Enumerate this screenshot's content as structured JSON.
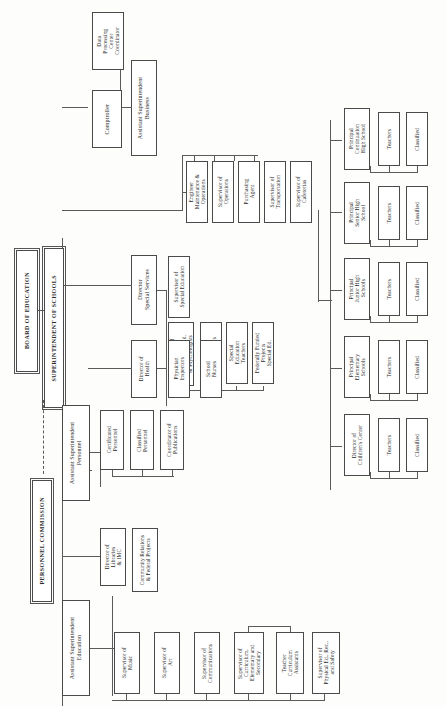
{
  "diagram": {
    "type": "organization-chart",
    "orientation": "rotated-90-text-vertical",
    "line_color": "#5a5a5a",
    "box_fill": "#ffffff",
    "box_border": "#4a4a4a"
  },
  "nodes": {
    "board_of_education": "BOARD OF EDUCATION",
    "superintendent_of_schools": "SUPERINTENDENT OF SCHOOLS",
    "personnel_commission": "PERSONNEL COMMISSION",
    "asst_supt_business": "Assistant Superintendent\nBusiness",
    "asst_supt_personnel": "Assistant Superintendent\nPersonnel",
    "asst_supt_education": "Assistant Superintendent\nEducation",
    "data_processing_center_coordinator": "Data\nProcessing\nCenter\nCoordinator",
    "comptroller": "Comptroller",
    "engineer_maintenance_operations": "Engineer\nMaintenance &\nOperations",
    "supervisor_of_operations": "Supervisor of\nOperations",
    "purchasing_agent": "Purchasing\nAgent",
    "supervisor_of_transportation": "Supervisor of\nTransportation",
    "supervisor_of_cafeterias": "Supervisor of\nCafeterias",
    "director_special_services": "Director\nSpecial Services",
    "supervisor_of_special_education": "Supervisor of\nSpecial Education",
    "supervisor_child_welfare": "Supervisor of\nChild\nWelfare, Attend.\n& Psychologists",
    "school_psychologists": "School\nPsychologists",
    "special_education_teachers": "Special\nEducation\nTeachers",
    "federally_funded_projects_special_ed": "Federally Funded\nProjects\nSpecial Ed.",
    "director_of_health": "Director of\nHealth",
    "physician_inspectors": "Physician\nInspectors",
    "school_nurses": "School\nNurses",
    "certificated_personnel": "Certificated\nPersonnel",
    "classified_personnel": "Classified\nPersonnel",
    "coordinator_of_publications": "Coordinator of\nPublications",
    "director_of_libraries_imc": "Director of\nLibraries\n& IMC",
    "community_relations_federal_projects": "Community Relations\n& Federal Projects",
    "supervisor_of_music": "Supervisor of\nMusic",
    "supervisor_of_art": "Supervisor of\nArt",
    "supervisor_of_communications": "Supervisor of\nCommunications",
    "supervisor_of_curriculum": "Supervisor of\nCurriculum,\nElementary and\nSecondary",
    "teacher_curriculum_assistants": "Teacher\nCurriculum\nAssistants",
    "supervisor_physical_ed": "Supervisor of\nPhysical Ed., Rec.,\nand Safety",
    "principal_continuation_high_school": "Principal\nContinuation\nHigh School",
    "principal_senior_high_school": "Principal\nSenior High\nSchool",
    "principal_junior_high_schools": "Principal\nJunior High\nSchools",
    "principal_elementary_schools": "Principal\nElementary\nSchools",
    "director_of_childrens_center": "Director of\nChildren's Center",
    "teachers_continuation": "Teachers",
    "classified_continuation": "Classified",
    "teachers_senior": "Teachers",
    "classified_senior": "Classified",
    "teachers_junior": "Teachers",
    "classified_junior": "Classified",
    "teachers_elementary": "Teachers",
    "classified_elementary": "Classified",
    "teachers_childrens_center": "Teachers",
    "classified_childrens_center": "Classified"
  }
}
